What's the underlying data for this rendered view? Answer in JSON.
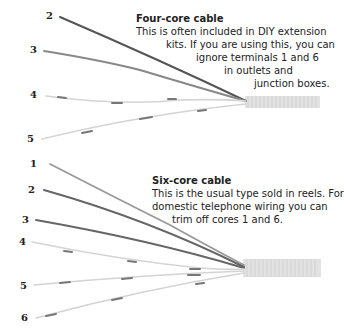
{
  "four_core": {
    "title": "Four-core cable",
    "lines": [
      "This is often included in DIY extension",
      "kits. If you are using this, you can",
      "ignore terminals 1 and 6",
      "in outlets and",
      "junction boxes."
    ],
    "core_labels": [
      "2",
      "3",
      "4",
      "5"
    ]
  },
  "six_core": {
    "title": "Six-core cable",
    "lines": [
      "This is the usual type sold in reels. For",
      "domestic telephone wiring you can",
      "trim off cores 1 and 6."
    ],
    "core_labels": [
      "1",
      "2",
      "3",
      "4",
      "5",
      "6"
    ]
  },
  "colors": {
    "dark_core": "#555555",
    "mid_core": "#8a8a8a",
    "light_core": "#cfcfcf",
    "stripe": "#777777",
    "sheath": "#dcdcdc"
  }
}
